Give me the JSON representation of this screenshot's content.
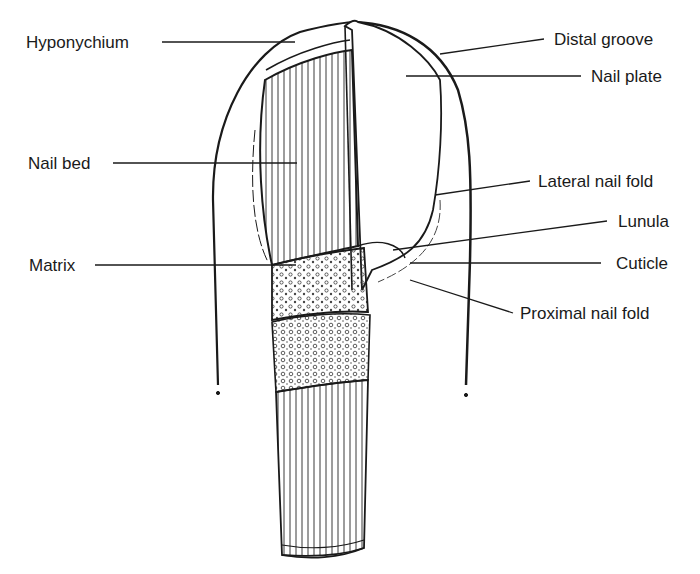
{
  "diagram": {
    "labels_left": [
      {
        "id": "hyponychium",
        "text": "Hyponychium"
      },
      {
        "id": "nail-bed",
        "text": "Nail bed"
      },
      {
        "id": "matrix",
        "text": "Matrix"
      }
    ],
    "labels_right": [
      {
        "id": "distal-groove",
        "text": "Distal groove"
      },
      {
        "id": "nail-plate",
        "text": "Nail plate"
      },
      {
        "id": "lateral-nail-fold",
        "text": "Lateral nail fold"
      },
      {
        "id": "lunula",
        "text": "Lunula"
      },
      {
        "id": "cuticle",
        "text": "Cuticle"
      },
      {
        "id": "proximal-nail-fold",
        "text": "Proximal nail fold"
      }
    ],
    "colors": {
      "ink": "#1a1a1a",
      "background": "#ffffff"
    }
  }
}
